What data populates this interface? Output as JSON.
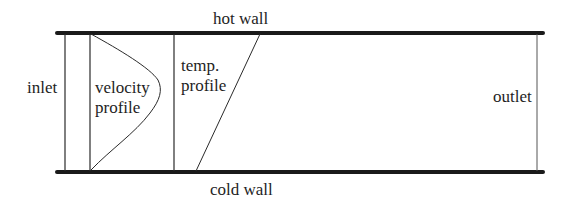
{
  "diagram": {
    "type": "channel-flow-schematic",
    "labels": {
      "hot_wall": "hot wall",
      "cold_wall": "cold wall",
      "inlet": "inlet",
      "outlet": "outlet",
      "velocity_profile_line1": "velocity",
      "velocity_profile_line2": "profile",
      "temp_profile_line1": "temp.",
      "temp_profile_line2": "profile"
    },
    "elements": {
      "top_wall": {
        "x1": 57,
        "x2": 543,
        "y": 33,
        "stroke": "#1a1a1a",
        "width": 4
      },
      "bottom_wall": {
        "x1": 57,
        "x2": 543,
        "y": 172,
        "stroke": "#1a1a1a",
        "width": 4
      },
      "inlet_line": {
        "x": 65
      },
      "velocity_baseline": {
        "x": 90
      },
      "velocity_peak": {
        "x": 160,
        "y": 88
      },
      "temp_baseline": {
        "x": 174
      },
      "temp_line": {
        "x1": 260,
        "y1": 34,
        "x2": 196,
        "y2": 171
      },
      "outlet_line": {
        "x": 537
      }
    },
    "colors": {
      "ink": "#1a1a1a",
      "background": "#ffffff"
    }
  }
}
